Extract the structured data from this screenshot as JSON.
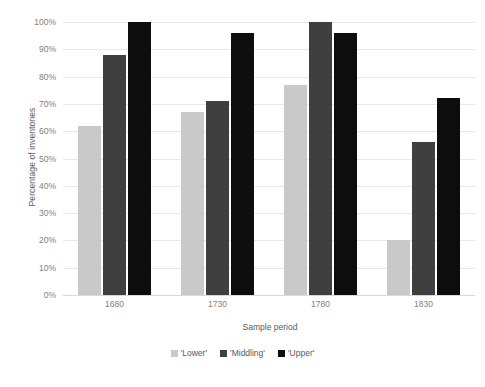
{
  "chart_data": {
    "type": "bar",
    "title": "",
    "xlabel": "Sample period",
    "ylabel": "Percentage of inventories",
    "categories": [
      "1680",
      "1730",
      "1780",
      "1830"
    ],
    "series": [
      {
        "name": "'Lower'",
        "color": "#c9c9c9",
        "values": [
          62,
          67,
          77,
          20
        ]
      },
      {
        "name": "'Middling'",
        "color": "#3f3f3f",
        "values": [
          88,
          71,
          100,
          56
        ]
      },
      {
        "name": "'Upper'",
        "color": "#0d0d0d",
        "values": [
          100,
          96,
          96,
          72
        ]
      }
    ],
    "ylim": [
      0,
      100
    ],
    "ytick_labels": [
      "100%",
      "90%",
      "80%",
      "70%",
      "60%",
      "50%",
      "40%",
      "30%",
      "20%",
      "10%",
      "0%"
    ],
    "ytick_values": [
      100,
      90,
      80,
      70,
      60,
      50,
      40,
      30,
      20,
      10,
      0
    ],
    "grid": true,
    "legend_position": "bottom",
    "value_suffix": "%"
  }
}
